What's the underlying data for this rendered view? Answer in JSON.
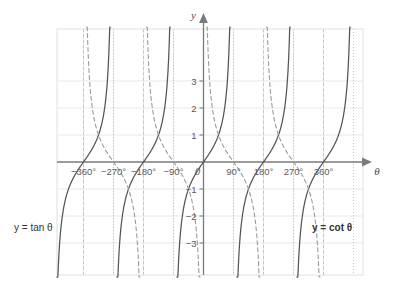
{
  "chart_data": {
    "type": "line",
    "title": "",
    "xlabel": "θ",
    "ylabel": "y",
    "xlim": [
      -420,
      400
    ],
    "ylim": [
      -4.3,
      4.3
    ],
    "grid": true,
    "legend_position": "inline-annotations",
    "x_tick_labels": [
      "−360°",
      "−270°",
      "−180°",
      "−90°",
      "90°",
      "180°",
      "270°",
      "360°"
    ],
    "x_tick_values": [
      -360,
      -270,
      -180,
      -90,
      90,
      180,
      270,
      360
    ],
    "y_tick_labels": [
      "3",
      "2",
      "1",
      "−1",
      "−2",
      "−3"
    ],
    "y_tick_values": [
      3,
      2,
      1,
      -1,
      -2,
      -3
    ],
    "origin_label": "0",
    "x_gridlines": [
      -360,
      -270,
      -180,
      -90,
      0,
      90,
      180,
      270,
      360
    ],
    "y_gridlines": [
      3,
      2,
      1,
      -1,
      -2,
      -3
    ],
    "series": [
      {
        "name": "y = tan θ",
        "style": "solid",
        "color": "#555555",
        "asymptotes": [
          -450,
          -270,
          -90,
          90,
          270,
          450
        ],
        "period": 180,
        "zeros": [
          -360,
          -180,
          0,
          180,
          360
        ]
      },
      {
        "name": "y = cot θ",
        "style": "dashed",
        "color": "#9a9a9a",
        "asymptotes": [
          -360,
          -180,
          0,
          180,
          360
        ],
        "period": 180,
        "zeros": [
          -450,
          -270,
          -90,
          90,
          270,
          450
        ]
      }
    ],
    "annotations": [
      {
        "text": "y = tan θ",
        "x": -430,
        "y": -2.55,
        "bold": false
      },
      {
        "text": "y = cot θ",
        "x": 300,
        "y": -2.55,
        "bold": true
      }
    ],
    "colors": {
      "background": "#ffffff",
      "grid": "#e8e8e8",
      "plot_border": "#e0e0e0",
      "axis": "#7a7a7a",
      "asymptote": "#c4c4c4",
      "tan_curve": "#555555",
      "cot_curve": "#9a9a9a",
      "tick_text": "#5a5a5a"
    }
  }
}
